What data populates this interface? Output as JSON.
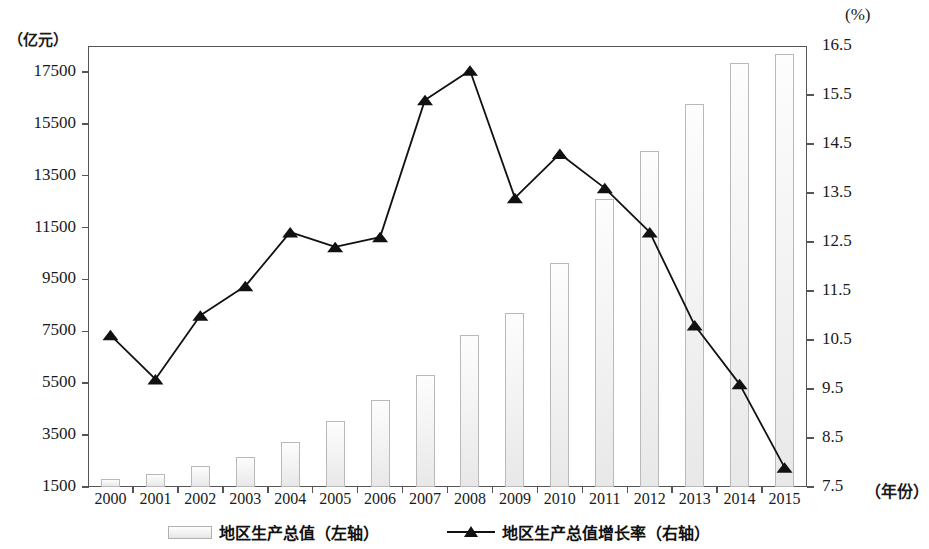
{
  "chart_data": {
    "type": "bar",
    "title": "",
    "subtitle": "",
    "categories": [
      "2000",
      "2001",
      "2002",
      "2003",
      "2004",
      "2005",
      "2006",
      "2007",
      "2008",
      "2009",
      "2010",
      "2011",
      "2012",
      "2013",
      "2014",
      "2015"
    ],
    "xlabel": "（年份）",
    "left_axis": {
      "label": "（亿元）",
      "ticks": [
        "1500",
        "3500",
        "5500",
        "7500",
        "9500",
        "11500",
        "13500",
        "15500",
        "17500"
      ],
      "tick_values": [
        1500,
        3500,
        5500,
        7500,
        9500,
        11500,
        13500,
        15500,
        17500
      ],
      "ylim": [
        1500,
        18500
      ],
      "unit": "亿元"
    },
    "right_axis": {
      "label": "(%)",
      "ticks": [
        "7.5",
        "8.5",
        "9.5",
        "10.5",
        "11.5",
        "12.5",
        "13.5",
        "14.5",
        "15.5",
        "16.5"
      ],
      "tick_values": [
        7.5,
        8.5,
        9.5,
        10.5,
        11.5,
        12.5,
        13.5,
        14.5,
        15.5,
        16.5
      ],
      "ylim": [
        7.5,
        16.5
      ],
      "unit": "%"
    },
    "grid": false,
    "legend_position": "bottom",
    "series": [
      {
        "name": "地区生产总值（左轴）",
        "short_name": "地区生产总值",
        "axis_note": "（左轴）",
        "type": "bar",
        "axis": "left",
        "color": "#eeeeee",
        "border_color": "#b9b9b9",
        "values": [
          1800,
          2000,
          2300,
          2650,
          3250,
          4050,
          4850,
          5800,
          7350,
          8200,
          10150,
          12600,
          14450,
          16250,
          17850,
          18200
        ]
      },
      {
        "name": "地区生产总值增长率（右轴）",
        "short_name": "地区生产总值增长率",
        "axis_note": "（右轴）",
        "type": "line",
        "axis": "right",
        "color": "#111111",
        "marker": "triangle",
        "values": [
          10.6,
          9.7,
          11.0,
          11.6,
          12.7,
          12.4,
          12.6,
          15.4,
          16.0,
          13.4,
          14.3,
          13.6,
          12.7,
          10.8,
          9.6,
          7.9
        ]
      }
    ]
  },
  "colors": {
    "bar_fill": "#eeeeee",
    "bar_border": "#b9b9b9",
    "line": "#111111",
    "axis": "#555555",
    "text": "#1a1a1a"
  }
}
